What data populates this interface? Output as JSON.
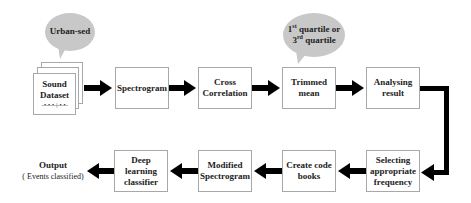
{
  "diagram": {
    "colors": {
      "bubble_fill": "#c8c8c8",
      "box_border": "#a8a8a8",
      "arrow": "#000000"
    },
    "bubbles": {
      "dataset_source": "Urban-sed",
      "trim_note": {
        "line1_num": "1",
        "line1_sup": "st",
        "line1_rest": " quartile or",
        "line2_num": "3",
        "line2_sup": "rd",
        "line2_rest": " quartile"
      }
    },
    "top_row": [
      {
        "line1": "Sound",
        "line2": "Dataset",
        "waveform": "–•–•–•–|–•–•–"
      },
      {
        "line1": "Spectrogram",
        "line2": ""
      },
      {
        "line1": "Cross",
        "line2": "Correlation"
      },
      {
        "line1": "Trimmed",
        "line2": "mean"
      },
      {
        "line1": "Analysing",
        "line2": "result"
      }
    ],
    "bottom_row": [
      {
        "line1": "Selecting",
        "line2": "appropriate",
        "line3": "frequency"
      },
      {
        "line1": "Create code",
        "line2": "books"
      },
      {
        "line1": "Modified",
        "line2": "Spectrogram"
      },
      {
        "line1": "Deep learning",
        "line2": "classifier"
      }
    ],
    "output": {
      "title": "Output",
      "subtitle": "( Events classified)"
    }
  }
}
